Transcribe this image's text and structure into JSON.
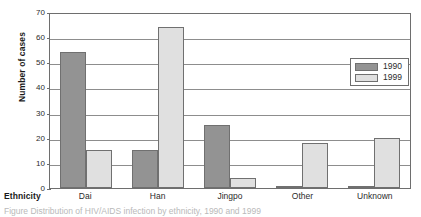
{
  "chart_data": {
    "type": "bar",
    "title": "",
    "xlabel": "Ethnicity",
    "ylabel": "Number of cases",
    "categories": [
      "Dai",
      "Han",
      "Jingpo",
      "Other",
      "Unknown"
    ],
    "series": [
      {
        "name": "1990",
        "color": "#939393",
        "values": [
          54,
          15,
          25,
          1,
          1
        ]
      },
      {
        "name": "1999",
        "color": "#e0e0e0",
        "values": [
          15,
          64,
          4,
          18,
          20
        ]
      }
    ],
    "ylim": [
      0,
      70
    ],
    "yticks": [
      0,
      10,
      20,
      30,
      40,
      50,
      60,
      70
    ],
    "ytick_labels": [
      "0",
      "10",
      "20",
      "30",
      "40",
      "50",
      "60",
      "70"
    ],
    "grid": "horizontal",
    "legend_position": "upper-right-inside"
  },
  "caption": "Figure   Distribution of HIV/AIDS infection by ethnicity, 1990 and 1999"
}
